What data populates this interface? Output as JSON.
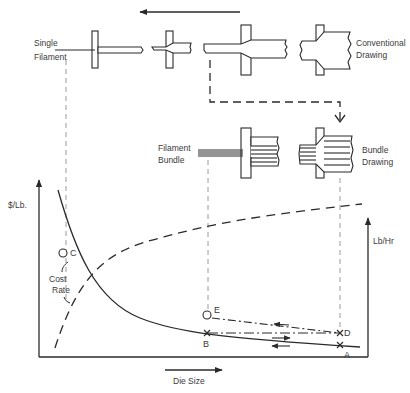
{
  "diagram": {
    "top_labels": {
      "single": "Single",
      "filament": "Filament",
      "conventional": "Conventional",
      "drawing": "Drawing"
    },
    "middle_labels": {
      "filament": "Filament",
      "bundle": "Bundle",
      "bundle_drawing_1": "Bundle",
      "bundle_drawing_2": "Drawing"
    },
    "chart": {
      "y_left_label": "$/Lb.",
      "y_right_label": "Lb/Hr",
      "x_label": "Die Size",
      "curve_labels": {
        "cost": "Cost",
        "rate": "Rate"
      },
      "points": {
        "A": "A",
        "B": "B",
        "C": "C",
        "D": "D",
        "E": "E"
      }
    },
    "colors": {
      "ink": "#2a2a2a",
      "guide": "#9a9a9a",
      "background": "#ffffff"
    }
  }
}
